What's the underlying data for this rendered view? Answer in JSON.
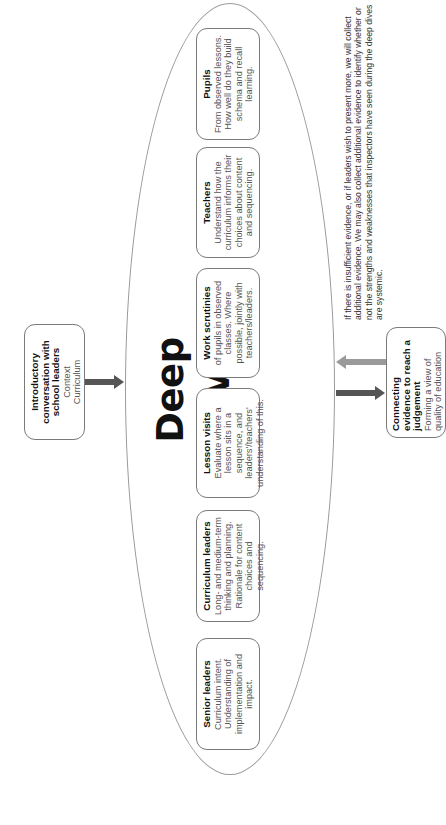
{
  "diagram": {
    "title": "Deep dive",
    "intro_box": {
      "title": "Introductory conversation with school leaders",
      "lines": [
        "Context",
        "Curriculum"
      ]
    },
    "deep_dive_boxes": [
      {
        "title": "Senior leaders",
        "description": "Curriculum intent. Understanding of implementation and impact."
      },
      {
        "title": "Curriculum leaders",
        "description": "Long- and medium-term thinking and planning. Rationale for content choices and sequencing."
      },
      {
        "title": "Lesson visits",
        "description": "Evaluate where a lesson sits in a sequence, and leaders'/teachers' understanding of this."
      },
      {
        "title": "Work scrutinies",
        "description": "of pupils in observed classes. Where possible, jointly with teachers/leaders."
      },
      {
        "title": "Teachers",
        "description": "Understand how the curriculum informs their choices about content and sequencing."
      },
      {
        "title": "Pupils",
        "description": "From observed lessons. How well do they build schema and recall learning."
      }
    ],
    "connect_box": {
      "title": "Connecting evidence to reach a judgement",
      "description": "Forming a view of quality of education"
    },
    "note": "If there is insufficient evidence, or if leaders wish to present more, we will collect additional evidence. We may also collect additional evidence to identify whether or not the strengths and weaknesses that inspectors have seen during the deep dives are systemic.",
    "colors": {
      "arrow_dark": "#555555",
      "arrow_light": "#9a9a9a",
      "ellipse_border": "#9a9a9a",
      "box_border": "#7a7a7a"
    }
  }
}
